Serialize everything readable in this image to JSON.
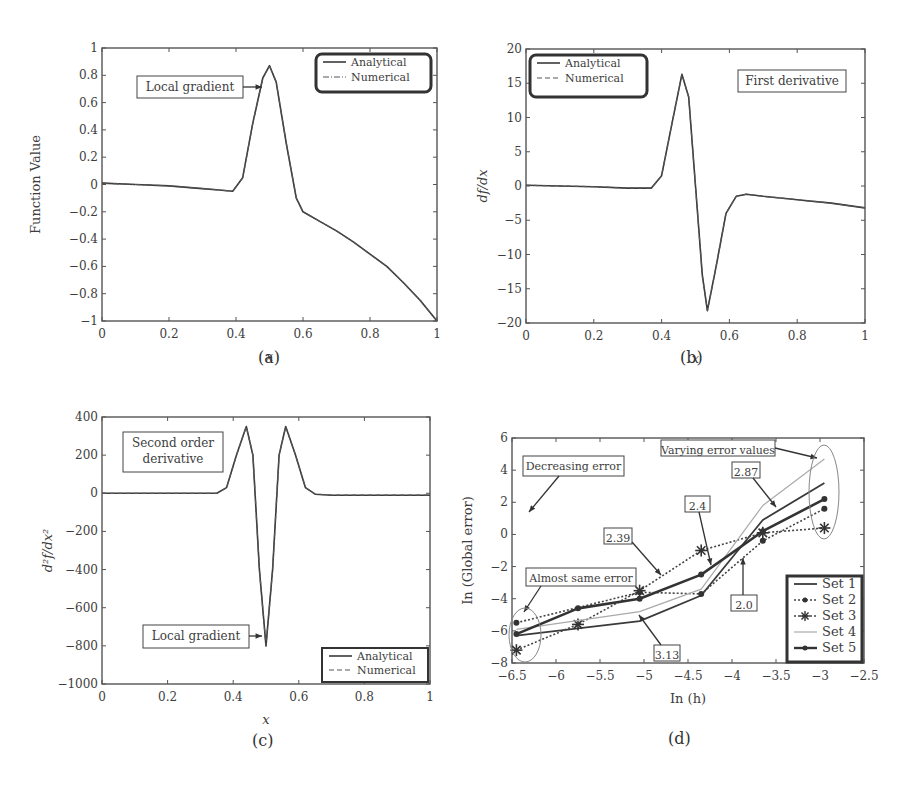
{
  "chart_data": [
    {
      "id": "a",
      "type": "line",
      "caption": "(a)",
      "xlabel": "x",
      "ylabel": "Function Value",
      "xlim": [
        0,
        1
      ],
      "ylim": [
        -1,
        1
      ],
      "xticks": [
        "0",
        "0.2",
        "0.4",
        "0.6",
        "0.8",
        "1"
      ],
      "yticks": [
        "1",
        "0.8",
        "0.6",
        "0.4",
        "0.2",
        "0",
        "−0.2",
        "−0.4",
        "−0.6",
        "−0.8",
        "−1"
      ],
      "legend": [
        "Analytical",
        "Numerical"
      ],
      "legend_position": "upper right",
      "annotations": [
        "Local gradient"
      ],
      "series": [
        {
          "name": "Analytical",
          "style": "solid",
          "x": [
            0,
            0.1,
            0.2,
            0.3,
            0.35,
            0.39,
            0.42,
            0.45,
            0.48,
            0.5,
            0.52,
            0.55,
            0.58,
            0.6,
            0.65,
            0.7,
            0.75,
            0.8,
            0.85,
            0.9,
            0.95,
            1.0
          ],
          "y": [
            0.01,
            0.0,
            -0.01,
            -0.03,
            -0.04,
            -0.05,
            0.05,
            0.45,
            0.78,
            0.87,
            0.75,
            0.3,
            -0.1,
            -0.2,
            -0.27,
            -0.34,
            -0.42,
            -0.51,
            -0.6,
            -0.72,
            -0.85,
            -1.0
          ]
        },
        {
          "name": "Numerical",
          "style": "dash-dot",
          "x": [
            0,
            0.1,
            0.2,
            0.3,
            0.35,
            0.39,
            0.42,
            0.45,
            0.48,
            0.5,
            0.52,
            0.55,
            0.58,
            0.6,
            0.65,
            0.7,
            0.75,
            0.8,
            0.85,
            0.9,
            0.95,
            1.0
          ],
          "y": [
            0.01,
            0.0,
            -0.01,
            -0.03,
            -0.04,
            -0.05,
            0.05,
            0.45,
            0.78,
            0.87,
            0.75,
            0.3,
            -0.1,
            -0.2,
            -0.27,
            -0.34,
            -0.42,
            -0.51,
            -0.6,
            -0.72,
            -0.85,
            -1.0
          ]
        }
      ]
    },
    {
      "id": "b",
      "type": "line",
      "caption": "(b)",
      "xlabel": "x",
      "ylabel": "df/dx",
      "xlim": [
        0,
        1
      ],
      "ylim": [
        -20,
        20
      ],
      "xticks": [
        "0",
        "0.2",
        "0.4",
        "0.6",
        "0.8",
        "1"
      ],
      "yticks": [
        "20",
        "15",
        "10",
        "5",
        "0",
        "−5",
        "−10",
        "−15",
        "−20"
      ],
      "legend": [
        "Analytical",
        "Numerical"
      ],
      "legend_position": "upper left",
      "annotations": [
        "First derivative"
      ],
      "series": [
        {
          "name": "Analytical",
          "style": "solid",
          "x": [
            0,
            0.1,
            0.2,
            0.3,
            0.37,
            0.4,
            0.43,
            0.46,
            0.48,
            0.5,
            0.52,
            0.535,
            0.56,
            0.59,
            0.62,
            0.65,
            0.7,
            0.8,
            0.9,
            1.0
          ],
          "y": [
            0.1,
            0.0,
            -0.1,
            -0.3,
            -0.3,
            1.5,
            9.0,
            16.3,
            13.0,
            0.0,
            -13.0,
            -18.2,
            -12.0,
            -4.0,
            -1.5,
            -1.2,
            -1.5,
            -2.0,
            -2.5,
            -3.2
          ]
        },
        {
          "name": "Numerical",
          "style": "dashed",
          "x": [
            0,
            0.1,
            0.2,
            0.3,
            0.37,
            0.4,
            0.43,
            0.46,
            0.48,
            0.5,
            0.52,
            0.535,
            0.56,
            0.59,
            0.62,
            0.65,
            0.7,
            0.8,
            0.9,
            1.0
          ],
          "y": [
            0.1,
            0.0,
            -0.1,
            -0.3,
            -0.3,
            1.5,
            9.0,
            16.3,
            13.0,
            0.0,
            -13.0,
            -18.2,
            -12.0,
            -4.0,
            -1.5,
            -1.2,
            -1.5,
            -2.0,
            -2.5,
            -3.2
          ]
        }
      ]
    },
    {
      "id": "c",
      "type": "line",
      "caption": "(c)",
      "xlabel": "x",
      "ylabel": "d²f/dx²",
      "xlim": [
        0,
        1
      ],
      "ylim": [
        -1000,
        400
      ],
      "xticks": [
        "0",
        "0.2",
        "0.4",
        "0.6",
        "0.8",
        "1"
      ],
      "yticks": [
        "400",
        "200",
        "0",
        "−200",
        "−400",
        "−600",
        "−800",
        "−1000"
      ],
      "legend": [
        "Analytical",
        "Numerical"
      ],
      "legend_position": "lower right",
      "annotations": [
        "Second order derivative",
        "Local gradient"
      ],
      "series": [
        {
          "name": "Analytical",
          "style": "solid",
          "x": [
            0,
            0.2,
            0.35,
            0.38,
            0.41,
            0.44,
            0.46,
            0.48,
            0.5,
            0.52,
            0.54,
            0.56,
            0.59,
            0.62,
            0.65,
            0.7,
            0.9,
            1.0
          ],
          "y": [
            0,
            0,
            0,
            30,
            200,
            350,
            200,
            -400,
            -800,
            -400,
            200,
            350,
            200,
            30,
            -5,
            -10,
            -10,
            -10
          ]
        },
        {
          "name": "Numerical",
          "style": "dashed",
          "x": [
            0,
            0.2,
            0.35,
            0.38,
            0.41,
            0.44,
            0.46,
            0.48,
            0.5,
            0.52,
            0.54,
            0.56,
            0.59,
            0.62,
            0.65,
            0.7,
            0.9,
            1.0
          ],
          "y": [
            0,
            0,
            0,
            30,
            200,
            350,
            200,
            -400,
            -800,
            -400,
            200,
            350,
            200,
            30,
            -5,
            -10,
            -10,
            -10
          ]
        }
      ]
    },
    {
      "id": "d",
      "type": "line",
      "caption": "(d)",
      "xlabel": "In (h)",
      "ylabel": "In (Global error)",
      "xlim": [
        -6.5,
        -2.5
      ],
      "ylim": [
        -8,
        6
      ],
      "xticks": [
        "−6.5",
        "−6",
        "−5.5",
        "−5",
        "−4.5",
        "−4",
        "−3.5",
        "−3",
        "−2.5"
      ],
      "yticks": [
        "6",
        "4",
        "2",
        "0",
        "−2",
        "−4",
        "−6",
        "−8"
      ],
      "legend": [
        "Set 1",
        "Set 2",
        "Set 3",
        "Set 4",
        "Set 5"
      ],
      "legend_position": "lower right",
      "annotations": [
        "Decreasing error",
        "Varying error values",
        "Almost same error",
        "2.87",
        "2.4",
        "2.39",
        "2.0",
        "3.13"
      ],
      "series": [
        {
          "name": "Set 1",
          "style": "thin solid",
          "x": [
            -6.45,
            -5.05,
            -4.35,
            -3.65,
            -2.95
          ],
          "y": [
            -6.3,
            -5.4,
            -3.8,
            0.9,
            3.2
          ]
        },
        {
          "name": "Set 2",
          "style": "dotted, dot markers",
          "x": [
            -6.45,
            -5.05,
            -4.35,
            -3.65,
            -2.95
          ],
          "y": [
            -5.5,
            -3.6,
            -3.7,
            -0.4,
            1.6
          ]
        },
        {
          "name": "Set 3",
          "style": "dotted, star markers",
          "x": [
            -6.45,
            -5.75,
            -5.05,
            -4.35,
            -3.65,
            -2.95
          ],
          "y": [
            -7.2,
            -5.6,
            -3.5,
            -1.0,
            0.1,
            0.4
          ]
        },
        {
          "name": "Set 4",
          "style": "light gray",
          "x": [
            -6.45,
            -5.05,
            -4.35,
            -3.65,
            -2.95
          ],
          "y": [
            -5.9,
            -4.8,
            -3.4,
            1.8,
            4.7
          ]
        },
        {
          "name": "Set 5",
          "style": "thick solid, dot markers",
          "x": [
            -6.45,
            -5.75,
            -5.05,
            -4.35,
            -3.65,
            -2.95
          ],
          "y": [
            -6.2,
            -4.6,
            -4.0,
            -2.5,
            0.2,
            2.2
          ]
        }
      ]
    }
  ]
}
